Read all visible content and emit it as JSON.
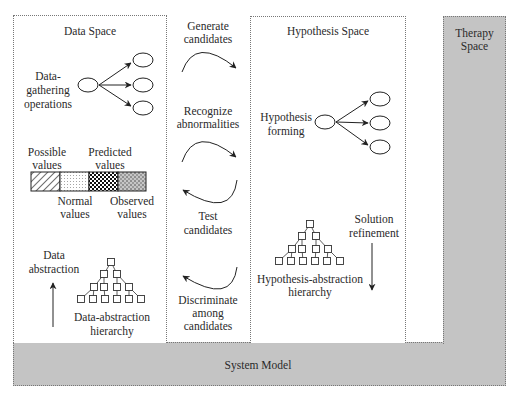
{
  "colors": {
    "gray_fill": "#c4c4c4",
    "border": "#777777",
    "line": "#333333"
  },
  "data_space": {
    "title": "Data Space",
    "gathering_label_1": "Data-",
    "gathering_label_2": "gathering",
    "gathering_label_3": "operations",
    "pattern_bar": {
      "top_labels": [
        "Possible values",
        "Predicted values"
      ],
      "bottom_labels": [
        "Normal values",
        "Observed values"
      ],
      "segments": [
        "hatched",
        "dotted",
        "checkered",
        "speckled"
      ]
    },
    "possible_1": "Possible",
    "possible_2": "values",
    "predicted_1": "Predicted",
    "predicted_2": "values",
    "normal_1": "Normal",
    "normal_2": "values",
    "observed_1": "Observed",
    "observed_2": "values",
    "abstraction_1": "Data",
    "abstraction_2": "abstraction",
    "hierarchy_1": "Data-abstraction",
    "hierarchy_2": "hierarchy"
  },
  "middle": {
    "steps": [
      {
        "line1": "Generate",
        "line2": "candidates",
        "direction": "forward"
      },
      {
        "line1": "Recognize",
        "line2": "abnormalities",
        "direction": "forward"
      },
      {
        "line1": "Test",
        "line2": "candidates",
        "direction": "backward"
      },
      {
        "line1": "Discriminate",
        "line2": "among",
        "line3": "candidates",
        "direction": "backward"
      }
    ]
  },
  "hypothesis_space": {
    "title": "Hypothesis Space",
    "forming_1": "Hypothesis",
    "forming_2": "forming",
    "hierarchy_1": "Hypothesis-abstraction",
    "hierarchy_2": "hierarchy",
    "refinement_1": "Solution",
    "refinement_2": "refinement"
  },
  "therapy_space": {
    "title_1": "Therapy",
    "title_2": "Space"
  },
  "system_model": {
    "title": "System Model"
  }
}
